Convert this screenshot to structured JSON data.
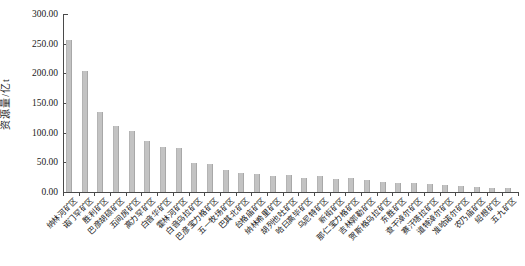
{
  "figure": {
    "background": "#ffffff",
    "title": ""
  },
  "chart_data": {
    "type": "bar",
    "title": "",
    "xlabel": "",
    "ylabel": "资源量/亿t",
    "ylim": [
      0,
      300
    ],
    "ytick_interval": 50,
    "ytick_labels": [
      "0.00",
      "50.00",
      "100.00",
      "150.00",
      "200.00",
      "250.00",
      "300.00"
    ],
    "grid": "off",
    "legend": "none",
    "bar_color": "#c3c3c3",
    "axis_color": "#4a4a4a",
    "text_color": "#1a1a1a",
    "categories": [
      "纳林河矿区",
      "诺门罕矿区",
      "胜利矿区",
      "巴彦胡硕矿区",
      "五间房矿区",
      "高力罕矿区",
      "白音华矿区",
      "霍林河矿区",
      "白音乌拉矿区",
      "巴彦宝力格矿区",
      "五一牧场矿区",
      "巴其北矿区",
      "台格庙矿区",
      "纳林希里矿区",
      "胡列也吐矿区",
      "哈日高毕矿区",
      "乌尼特矿区",
      "新街矿区",
      "那仁宝力格矿区",
      "吉林郭勒矿区",
      "贺斯格乌拉矿区",
      "东胜矿区",
      "查干淖尔矿区",
      "赛汗塔拉矿区",
      "道特淖尔矿区",
      "准哈诺尔矿区",
      "农乃庙矿区",
      "绍根矿区",
      "五九矿区"
    ],
    "values": [
      255.5,
      203.5,
      134.5,
      111.0,
      103.0,
      86.5,
      76.0,
      75.0,
      49.0,
      47.0,
      36.5,
      32.5,
      30.0,
      26.5,
      28.0,
      24.0,
      26.5,
      22.5,
      24.0,
      21.0,
      17.0,
      15.0,
      14.5,
      14.0,
      12.5,
      10.0,
      8.5,
      7.0,
      6.0
    ]
  }
}
